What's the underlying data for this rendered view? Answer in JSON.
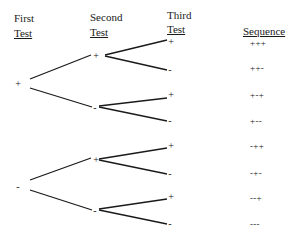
{
  "headers": {
    "first": {
      "line1": "First",
      "line2": "Test"
    },
    "second": {
      "line1": "Second",
      "line2": "Test"
    },
    "third": {
      "line1": "Third",
      "line2": "Test"
    },
    "sequence": "Sequence"
  },
  "tree": {
    "level1": [
      "+",
      "-"
    ],
    "level2": [
      "+",
      "-",
      "+",
      "-"
    ],
    "level3": [
      "+",
      "-",
      "+",
      "-",
      "+",
      "-",
      "+",
      "-"
    ]
  },
  "sequences": [
    "+++",
    "++-",
    "+-+",
    "+--",
    "-++",
    "-+-",
    "--+",
    "---"
  ]
}
